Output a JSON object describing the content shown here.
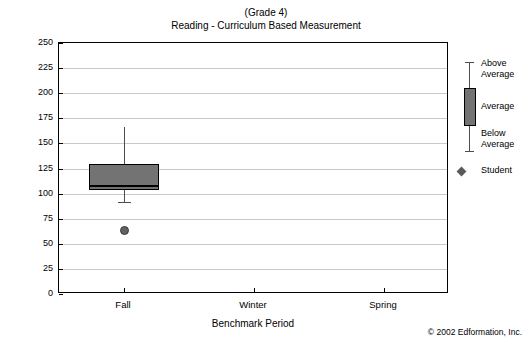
{
  "chart_data": {
    "type": "box",
    "title": "(Grade 4)",
    "subtitle": "Reading - Curriculum Based Measurement",
    "xlabel": "Benchmark Period",
    "ylabel": "Words Read Correct (WRC)",
    "ylim": [
      0,
      250
    ],
    "ytick_labels": [
      "0",
      "25",
      "50",
      "75",
      "100",
      "125",
      "150",
      "175",
      "200",
      "225",
      "250"
    ],
    "ytick_values": [
      0,
      25,
      50,
      75,
      100,
      125,
      150,
      175,
      200,
      225,
      250
    ],
    "grid": true,
    "categories": [
      "Fall",
      "Winter",
      "Spring"
    ],
    "boxes": [
      {
        "category": "Fall",
        "whisker_low": 92,
        "q1": 104,
        "median": 109,
        "q3": 129,
        "whisker_high": 166
      }
    ],
    "points": [
      {
        "category": "Fall",
        "series": "Student",
        "value": 63
      }
    ],
    "legend": {
      "position": "right",
      "entries": [
        {
          "label": "Above\nAverage",
          "marker": "whisker-upper"
        },
        {
          "label": "Average",
          "marker": "box"
        },
        {
          "label": "Below\nAverage",
          "marker": "whisker-lower"
        },
        {
          "label": "Student",
          "marker": "diamond"
        }
      ]
    },
    "colors": {
      "box_fill": "#737373",
      "box_border": "#000000",
      "whisker": "#4d4d4d",
      "grid": "#c9c9c9",
      "point": "#616161",
      "text": "#000000"
    }
  },
  "footer": {
    "copyright": "© 2002 Edformation, Inc."
  }
}
